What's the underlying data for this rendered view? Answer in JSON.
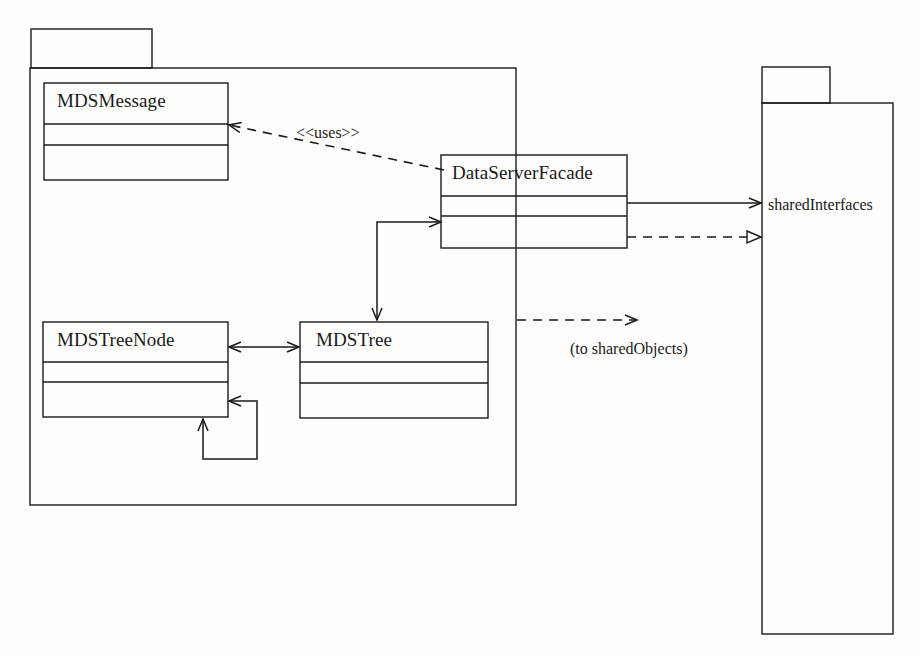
{
  "diagram": {
    "kind": "uml-package-class-diagram",
    "background_color": "#fdfdfb",
    "stroke_color": "#1a1a1a",
    "canvas": {
      "width": 920,
      "height": 656
    }
  },
  "packages": [
    {
      "id": "left-package",
      "name": "",
      "tab": {
        "x": 31,
        "y": 29,
        "w": 121,
        "h": 39
      },
      "body": {
        "x": 30,
        "y": 68,
        "w": 486,
        "h": 437
      }
    },
    {
      "id": "shared-interfaces-package",
      "name": "sharedInterfaces",
      "tab": {
        "x": 762,
        "y": 67,
        "w": 68,
        "h": 36
      },
      "body": {
        "x": 762,
        "y": 103,
        "w": 131,
        "h": 531
      },
      "label_x": 777,
      "label_y": 196
    }
  ],
  "classes": [
    {
      "id": "mds-message",
      "name": "MDSMessage",
      "x": 44,
      "y": 83,
      "w": 184,
      "h": 97,
      "dividers": [
        41,
        62
      ],
      "label_x": 57,
      "label_y": 92
    },
    {
      "id": "data-server-facade",
      "name": "DataServerFacade",
      "x": 441,
      "y": 155,
      "w": 186,
      "h": 93,
      "dividers": [
        41,
        61
      ],
      "label_x": 452,
      "label_y": 163
    },
    {
      "id": "mds-tree-node",
      "name": "MDSTreeNode",
      "x": 43,
      "y": 322,
      "w": 185,
      "h": 95,
      "dividers": [
        40,
        60
      ],
      "label_x": 57,
      "label_y": 331
    },
    {
      "id": "mds-tree",
      "name": "MDSTree",
      "x": 300,
      "y": 322,
      "w": 188,
      "h": 96,
      "dividers": [
        40,
        61
      ],
      "label_x": 316,
      "label_y": 331
    }
  ],
  "connectors": [
    {
      "id": "uses-dependency",
      "from": "data-server-facade",
      "to": "mds-message",
      "style": "dashed",
      "arrow": "open",
      "label": "<<uses>>",
      "label_x": 296,
      "label_y": 124
    },
    {
      "id": "facade-to-mdstree",
      "from": "data-server-facade",
      "to": "mds-tree",
      "style": "solid",
      "arrow": "open-both",
      "label": ""
    },
    {
      "id": "treenode-tree-association",
      "from": "mds-tree-node",
      "to": "mds-tree",
      "style": "solid",
      "arrow": "open-both",
      "label": ""
    },
    {
      "id": "treenode-self-association",
      "from": "mds-tree-node",
      "to": "mds-tree-node",
      "style": "solid",
      "arrow": "open-both",
      "label": ""
    },
    {
      "id": "facade-to-shared-interfaces-use",
      "from": "data-server-facade",
      "to": "shared-interfaces-package",
      "style": "solid",
      "arrow": "open",
      "label": ""
    },
    {
      "id": "facade-to-shared-interfaces-realize",
      "from": "data-server-facade",
      "to": "shared-interfaces-package",
      "style": "dashed",
      "arrow": "hollow-triangle",
      "label": ""
    },
    {
      "id": "to-shared-objects",
      "from": "left-package",
      "to": "sharedObjects",
      "style": "dashed",
      "arrow": "open",
      "label": "(to sharedObjects)",
      "label_x": 570,
      "label_y": 340
    }
  ]
}
